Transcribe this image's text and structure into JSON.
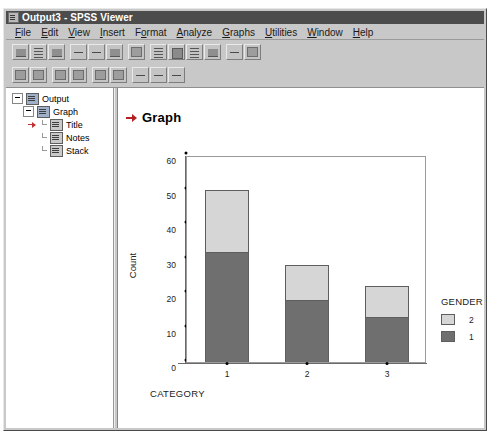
{
  "window": {
    "title": "Output3 - SPSS Viewer",
    "icon": "spss-viewer-icon"
  },
  "menu": {
    "items": [
      {
        "label": "File",
        "mnemonic": "F"
      },
      {
        "label": "Edit",
        "mnemonic": "E"
      },
      {
        "label": "View",
        "mnemonic": "V"
      },
      {
        "label": "Insert",
        "mnemonic": "I"
      },
      {
        "label": "Format",
        "mnemonic": "o"
      },
      {
        "label": "Analyze",
        "mnemonic": "A"
      },
      {
        "label": "Graphs",
        "mnemonic": "G"
      },
      {
        "label": "Utilities",
        "mnemonic": "U"
      },
      {
        "label": "Window",
        "mnemonic": "W"
      },
      {
        "label": "Help",
        "mnemonic": "H"
      }
    ]
  },
  "toolbar_primary": {
    "buttons": [
      {
        "name": "open-file-button",
        "glyph": "half"
      },
      {
        "name": "save-file-button",
        "glyph": "lines"
      },
      {
        "name": "print-button",
        "glyph": "half"
      },
      {
        "name": "print-preview-button",
        "glyph": "dash"
      },
      {
        "name": "export-button",
        "glyph": "dash"
      },
      {
        "name": "recall-dialog-button",
        "glyph": "half"
      },
      {
        "name": "undo-button",
        "glyph": "solid"
      },
      {
        "name": "goto-data-button",
        "glyph": "lines"
      },
      {
        "name": "goto-case-button",
        "glyph": "block"
      },
      {
        "name": "variables-button",
        "glyph": "lines"
      },
      {
        "name": "find-button",
        "glyph": "half"
      },
      {
        "name": "insert-cases-button",
        "glyph": "dash"
      },
      {
        "name": "select-cases-button",
        "glyph": "solid"
      }
    ]
  },
  "toolbar_secondary": {
    "buttons": [
      {
        "name": "promote-button",
        "glyph": "solid"
      },
      {
        "name": "demote-button",
        "glyph": "solid"
      },
      {
        "name": "expand-button",
        "glyph": "solid"
      },
      {
        "name": "collapse-button",
        "glyph": "solid"
      },
      {
        "name": "show-button",
        "glyph": "solid"
      },
      {
        "name": "hide-button",
        "glyph": "solid"
      },
      {
        "name": "insert-heading-button",
        "glyph": "dash"
      },
      {
        "name": "insert-title-button",
        "glyph": "dash"
      },
      {
        "name": "insert-text-button",
        "glyph": "dash"
      }
    ]
  },
  "outline": {
    "nodes": [
      {
        "label": "Output",
        "level": 1,
        "icon": "output-doc-icon",
        "expander": true,
        "selected": false
      },
      {
        "label": "Graph",
        "level": 2,
        "icon": "graph-doc-icon",
        "expander": true,
        "selected": false
      },
      {
        "label": "Title",
        "level": 3,
        "icon": "title-book-icon",
        "expander": false,
        "selected": true
      },
      {
        "label": "Notes",
        "level": 3,
        "icon": "notes-book-icon",
        "expander": false,
        "selected": false
      },
      {
        "label": "Stack",
        "level": 3,
        "icon": "stack-book-icon",
        "expander": false,
        "selected": false
      }
    ]
  },
  "output": {
    "heading": "Graph",
    "heading_marker": "red-arrow-icon"
  },
  "colors": {
    "title_bar": "#4c4c4c",
    "window_face": "#c8c8c8",
    "series_1": "#6f6f6f",
    "series_2": "#d6d6d6",
    "marker_red": "#b22222"
  },
  "chart_data": {
    "type": "bar",
    "title": "",
    "stacked": true,
    "categories": [
      "1",
      "2",
      "3"
    ],
    "series": [
      {
        "name": "1",
        "values": [
          32,
          18,
          13
        ],
        "color": "#6f6f6f"
      },
      {
        "name": "2",
        "values": [
          18,
          10,
          9
        ],
        "color": "#d6d6d6"
      }
    ],
    "totals": [
      50,
      28,
      22
    ],
    "xlabel": "CATEGORY",
    "ylabel": "Count",
    "ylim": [
      0,
      60
    ],
    "yticks": [
      0,
      10,
      20,
      30,
      40,
      50,
      60
    ],
    "ytick_labels": [
      "0",
      "10",
      "20",
      "30",
      "40",
      "50",
      "60"
    ],
    "grid": false,
    "legend": {
      "title": "GENDER",
      "position": "right",
      "entries": [
        {
          "label": "2",
          "color": "#d6d6d6"
        },
        {
          "label": "1",
          "color": "#6f6f6f"
        }
      ]
    }
  }
}
